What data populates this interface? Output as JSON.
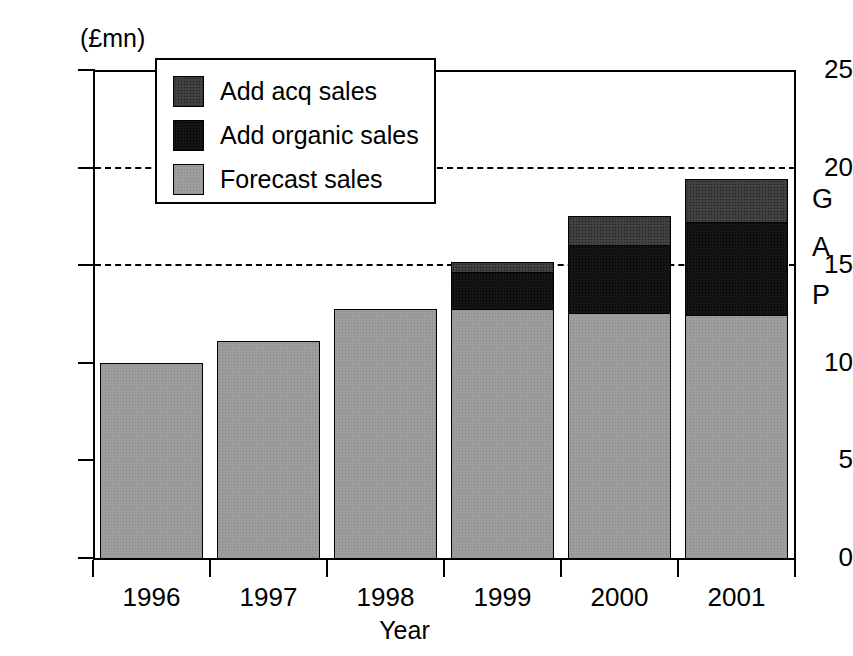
{
  "chart_data": {
    "type": "bar",
    "stacked": true,
    "title": "",
    "subtitle": "",
    "xlabel": "Year",
    "ylabel": "",
    "unit_label": "(£mn)",
    "categories": [
      "1996",
      "1997",
      "1998",
      "1999",
      "2000",
      "2001"
    ],
    "series": [
      {
        "name": "Forecast sales",
        "key": "forecast",
        "color": "#9a9a9a",
        "values": [
          10.0,
          11.1,
          12.75,
          12.8,
          12.6,
          12.45
        ]
      },
      {
        "name": "Add organic sales",
        "key": "organic",
        "color": "#141414",
        "values": [
          0.0,
          0.0,
          0.0,
          1.9,
          3.45,
          4.8
        ]
      },
      {
        "name": "Add acq sales",
        "key": "acq",
        "color": "#3d3d3d",
        "values": [
          0.0,
          0.0,
          0.0,
          0.45,
          1.45,
          2.15
        ]
      }
    ],
    "totals": [
      10.0,
      11.1,
      12.75,
      15.15,
      17.5,
      19.4
    ],
    "ylim": [
      0,
      25
    ],
    "yticks": [
      0,
      5,
      10,
      15,
      20,
      25
    ],
    "ytick_labels": [
      "0",
      "5",
      "10",
      "15",
      "20",
      "25"
    ],
    "gridlines": [
      15,
      20
    ],
    "grid": "dashed-horizontal-partial",
    "legend_position": "top-left-inside",
    "legend_entries": [
      "Add acq sales",
      "Add organic sales",
      "Forecast sales"
    ],
    "annotations": [
      {
        "name": "gap-label",
        "text": [
          "G",
          "A",
          "P"
        ],
        "position": "right-margin"
      }
    ]
  },
  "axes": {
    "y_unit": "(£mn)",
    "x_title": "Year"
  },
  "legend": {
    "items": [
      {
        "label": "Add acq sales",
        "color": "#3d3d3d"
      },
      {
        "label": "Add organic sales",
        "color": "#141414"
      },
      {
        "label": "Forecast sales",
        "color": "#9a9a9a"
      }
    ]
  },
  "gap_annotation": {
    "letters": [
      "G",
      "A",
      "P"
    ]
  }
}
